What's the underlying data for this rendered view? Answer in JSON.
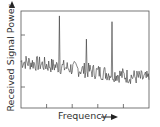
{
  "chart_data": {
    "type": "line",
    "title": "",
    "xlabel": "Frequency",
    "ylabel": "Received Signal Power",
    "x_ticks": 4,
    "y_ticks": 2,
    "tick_labels": [],
    "grid": false,
    "legend": null,
    "noise_floor": {
      "start_level": 0.48,
      "end_level": 0.3,
      "noise_amplitude": 0.08
    },
    "peaks": [
      {
        "x": 0.3,
        "height": 0.95
      },
      {
        "x": 0.51,
        "height": 0.71
      },
      {
        "x": 0.71,
        "height": 0.89
      }
    ],
    "xlim": [
      0,
      1
    ],
    "ylim": [
      0,
      1
    ]
  },
  "colors": {
    "axis": "#444444",
    "line": "#333333",
    "text": "#333333"
  },
  "labels": {
    "x": "Frequency",
    "y": "Received Signal Power"
  }
}
